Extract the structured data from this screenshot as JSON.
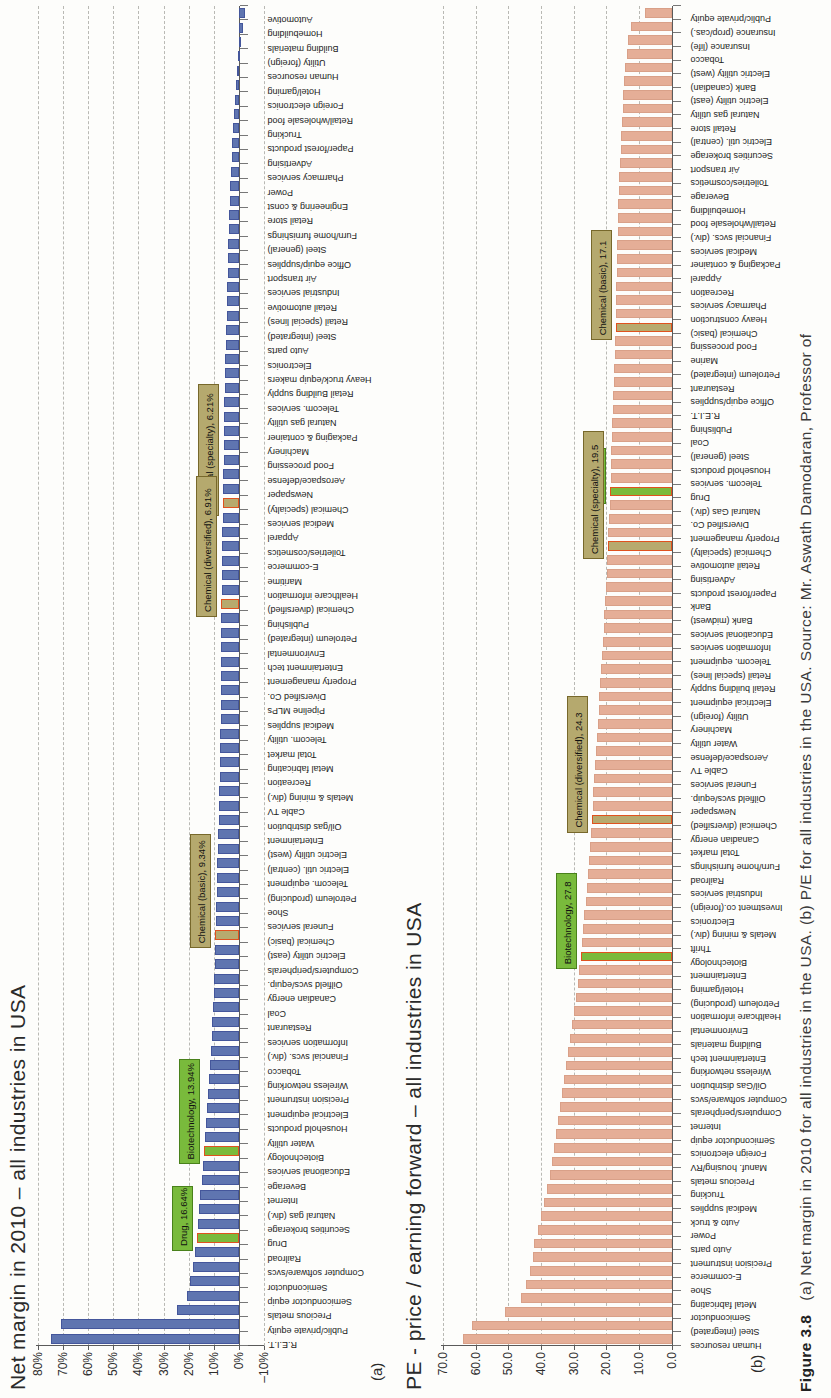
{
  "caption": {
    "prefix": "Figure 3.8",
    "text": "(a) Net margin in 2010 for all industries in the USA. (b) P/E for all industries in the USA. Source: Mr. Aswath Damodaran, Professor of"
  },
  "chart_a": {
    "panel_label": "(a)"
  },
  "chart_b": {
    "panel_label": "(b)"
  },
  "colors": {
    "bar_blue": "#5f75b0",
    "bar_salmon": "#e5ae97",
    "highlight_tan": "#b7aa6e",
    "highlight_green": "#7aba3c",
    "highlight_bar_border": "#e0521e",
    "callout_tan_border": "#77682b",
    "callout_green_border": "#49811b"
  },
  "chart_data": [
    {
      "type": "bar",
      "title": "Net margin in 2010 – all industries in USA",
      "xlabel": "",
      "ylabel": "Net margin (%)",
      "ylim": [
        -10,
        80
      ],
      "grid": "on",
      "ytick_labels": [
        "80%",
        "70%",
        "60%",
        "50%",
        "40%",
        "30%",
        "20%",
        "10%",
        "0%",
        "–10%"
      ],
      "ytick_values": [
        80,
        70,
        60,
        50,
        40,
        30,
        20,
        10,
        0,
        -10
      ],
      "categories": [
        "R.E.I.T.",
        "Public/private equity",
        "Precious metals",
        "Semiconductor equip",
        "Semiconductor",
        "Computer software/svcs",
        "Railroad",
        "Drug",
        "Securities brokerage",
        "Natural gas (div.)",
        "Internet",
        "Beverage",
        "Educational services",
        "Biotechnology",
        "Water utility",
        "Household products",
        "Electrical equipment",
        "Precision instrument",
        "Wireless networking",
        "Tobacco",
        "Financial svcs. (div.)",
        "Information services",
        "Restaurant",
        "Coal",
        "Canadian energy",
        "Oilfield svcs/equip.",
        "Computers/peripherals",
        "Electric utility (east)",
        "Chemical (basic)",
        "Funeral services",
        "Shoe",
        "Petroleum (producing)",
        "Telecom. equipment",
        "Electric util. (central)",
        "Electric utility (west)",
        "Entertainment",
        "Oil/gas distribution",
        "Cable TV",
        "Metals & mining (div.)",
        "Recreation",
        "Metal fabricating",
        "Total market",
        "Telecom. utility",
        "Medical supplies",
        "Pipeline MLPs",
        "Diversified Co.",
        "Property management",
        "Entertainment tech",
        "Environmental",
        "Petroleum (integrated)",
        "Publishing",
        "Chemical (diversified)",
        "Healthcare information",
        "Maritime",
        "E-commerce",
        "Toiletries/cosmetics",
        "Apparel",
        "Medical services",
        "Chemical (specialty)",
        "Newspaper",
        "Aerospace/defense",
        "Food processing",
        "Machinery",
        "Packaging & container",
        "Natural gas utility",
        "Telecom. services",
        "Retail Building supply",
        "Heavy truck/equip makers",
        "Electronics",
        "Auto parts",
        "Steel (integrated)",
        "Retail (special lines)",
        "Retail automotive",
        "Industrial services",
        "Air transport",
        "Office equip/supplies",
        "Steel (general)",
        "Furn/home furnishings",
        "Retail store",
        "Engineering & const",
        "Power",
        "Pharmacy services",
        "Advertising",
        "Paper/forest products",
        "Trucking",
        "Retail/wholesale food",
        "Foreign electronics",
        "Hotel/gaming",
        "Human resources",
        "Utility (foreign)",
        "Building materials",
        "Homebuilding",
        "Automotive"
      ],
      "values": [
        75,
        71,
        24.5,
        20.6,
        19.3,
        18.3,
        17.4,
        16.64,
        16.3,
        15.8,
        15.3,
        14.8,
        14.3,
        13.94,
        13.4,
        13.0,
        12.6,
        12.2,
        11.8,
        11.4,
        11.1,
        10.8,
        10.5,
        10.2,
        9.9,
        9.7,
        9.5,
        9.4,
        9.34,
        9.2,
        9.0,
        8.8,
        8.6,
        8.5,
        8.35,
        8.2,
        8.05,
        7.9,
        7.75,
        7.6,
        7.5,
        7.4,
        7.3,
        7.2,
        7.1,
        7.05,
        7.0,
        6.98,
        6.95,
        6.93,
        6.92,
        6.91,
        6.85,
        6.8,
        6.7,
        6.6,
        6.5,
        6.4,
        6.21,
        6.15,
        6.1,
        6.05,
        6.0,
        5.9,
        5.8,
        5.7,
        5.6,
        5.5,
        5.35,
        5.2,
        5.05,
        4.9,
        4.75,
        4.6,
        4.45,
        4.3,
        4.15,
        4.0,
        3.8,
        3.6,
        3.4,
        3.1,
        2.85,
        2.6,
        2.3,
        2.0,
        1.6,
        1.2,
        0.7,
        0.3,
        -0.6,
        -1.5,
        -2.5
      ],
      "highlights": {
        "tan": [
          "Chemical (specialty)",
          "Chemical (diversified)",
          "Chemical (basic)"
        ],
        "green": [
          "Biotechnology",
          "Drug"
        ]
      },
      "callouts": [
        {
          "category": "Chemical (specialty)",
          "label": "Chemical (specialty), 6.21%"
        },
        {
          "category": "Chemical (diversified)",
          "label": "Chemical (diversified), 6.91%"
        },
        {
          "category": "Chemical (basic)",
          "label": "Chemical (basic), 9.34%"
        },
        {
          "category": "Biotechnology",
          "label": "Biotechnology, 13.94%"
        },
        {
          "category": "Drug",
          "label": "Drug, 16.64%"
        }
      ]
    },
    {
      "type": "bar",
      "title": "PE - price / earning forward – all industries in USA",
      "xlabel": "",
      "ylabel": "Forward P/E",
      "ylim": [
        0,
        70
      ],
      "grid": "on",
      "ytick_labels": [
        "70.0",
        "60.0",
        "50.0",
        "40.0",
        "30.0",
        "20.0",
        "10.0",
        "0.0"
      ],
      "ytick_values": [
        70,
        60,
        50,
        40,
        30,
        20,
        10,
        0
      ],
      "categories": [
        "Human resources",
        "Steel (integrated)",
        "Semiconductor",
        "Metal fabricating",
        "Shoe",
        "E-commerce",
        "Precision instrument",
        "Auto parts",
        "Power",
        "Auto & truck",
        "Medical supplies",
        "Trucking",
        "Precious metals",
        "Manuf. housing/RV",
        "Foreign electronics",
        "Semiconductor equip",
        "Internet",
        "Computers/peripherals",
        "Computer software/svcs",
        "Oil/Gas distribution",
        "Wireless networking",
        "Entertainment tech",
        "Building materials",
        "Environmental",
        "Healthcare information",
        "Petroleum (producing)",
        "Hotel/gaming",
        "Entertainment",
        "Biotechnology",
        "Thrift",
        "Metals & mining (div.)",
        "Electronics",
        "Investment co.(foreign)",
        "Industrial services",
        "Railroad",
        "Furn/home furnishings",
        "Total market",
        "Canadian energy",
        "Chemical (diversified)",
        "Newspaper",
        "Oilfield svcs/equip.",
        "Funeral services",
        "Cable TV",
        "Aerospace/defense",
        "Water utility",
        "Machinery",
        "Utility (foreign)",
        "Electrical equipment",
        "Retail building supply",
        "Retail (special lines)",
        "Telecom. equipment",
        "Information services",
        "Educational services",
        "Bank (midwest)",
        "Bank",
        "Paper/forest products",
        "Advertising",
        "Retail automotive",
        "Chemical (specialty)",
        "Property management",
        "Diversified Co.",
        "Natural Gas (div.)",
        "Drug",
        "Telecom. services",
        "Household products",
        "Steel (general)",
        "Coal",
        "Publishing",
        "R.E.I.T.",
        "Office equip/supplies",
        "Restaurant",
        "Petroleum (integrated)",
        "Marine",
        "Food processing",
        "Chemical (basic)",
        "Heavy construction",
        "Pharmacy services",
        "Recreation",
        "Apparel",
        "Packaging & container",
        "Medical services",
        "Financial svcs. (div.)",
        "Retail/wholesale food",
        "Homebuilding",
        "Beverage",
        "Toiletries/cosmetics",
        "Air transport",
        "Securities brokerage",
        "Electric util. (central)",
        "Retail store",
        "Natural gas utility",
        "Electric utility (east)",
        "Bank (canadian)",
        "Electric utility (west)",
        "Tobacco",
        "Insurance (life)",
        "Insurance (prop/cas.)",
        "Public/private equity"
      ],
      "values": [
        64,
        61,
        51,
        46,
        44.5,
        43.5,
        42.5,
        42,
        41,
        40,
        39,
        38,
        37.2,
        36.5,
        35.9,
        35.3,
        34.7,
        34.1,
        33.5,
        32.9,
        32.3,
        31.7,
        31.1,
        30.5,
        29.9,
        29.3,
        28.8,
        28.3,
        27.8,
        27.4,
        27.0,
        26.7,
        26.3,
        26.0,
        25.65,
        25.3,
        24.95,
        24.6,
        24.3,
        24.15,
        23.95,
        23.7,
        23.4,
        23.1,
        22.85,
        22.6,
        22.35,
        22.1,
        21.85,
        21.6,
        21.35,
        21.1,
        20.85,
        20.6,
        20.35,
        20.1,
        19.9,
        19.7,
        19.5,
        19.35,
        19.2,
        19.0,
        18.8,
        18.7,
        18.55,
        18.45,
        18.3,
        18.15,
        18.0,
        17.85,
        17.7,
        17.55,
        17.4,
        17.25,
        17.1,
        17.0,
        16.95,
        16.9,
        16.8,
        16.7,
        16.6,
        16.5,
        16.4,
        16.3,
        16.15,
        16.0,
        15.8,
        15.6,
        15.4,
        15.2,
        15.0,
        14.8,
        14.5,
        14.2,
        13.8,
        13.2,
        12.5,
        8.0
      ],
      "highlights": {
        "tan": [
          "Chemical (basic)",
          "Chemical (specialty)",
          "Chemical (diversified)"
        ],
        "green": [
          "Drug",
          "Biotechnology"
        ]
      },
      "callouts": [
        {
          "category": "Chemical (basic)",
          "label": "Chemical (basic), 17.1"
        },
        {
          "category": "Drug",
          "label": "Drug, 18.8"
        },
        {
          "category": "Chemical (specialty)",
          "label": "Chemical (specialty), 19.5"
        },
        {
          "category": "Chemical (diversified)",
          "label": "Chemical (diversified), 24.3"
        },
        {
          "category": "Biotechnology",
          "label": "Biotechnology, 27.8"
        }
      ]
    }
  ]
}
